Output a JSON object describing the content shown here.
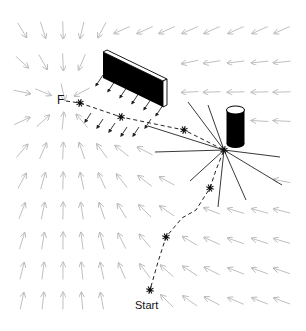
{
  "diagram": {
    "type": "potential-field-navigation",
    "labels": {
      "goal": "F",
      "start": "Start"
    },
    "colors": {
      "field_arrow": "#b8b8b8",
      "obstacle_fill": "#000000",
      "repulsive_line": "#222222",
      "path": "#222222",
      "robot_marker": "#111111"
    },
    "goal_point": [
      65,
      101
    ],
    "goal_label_pos": [
      57,
      93
    ],
    "start_label_pos": [
      135,
      299
    ],
    "robot_positions": [
      [
        80,
        103
      ],
      [
        121,
        117
      ],
      [
        184,
        130
      ],
      [
        224,
        150
      ],
      [
        210,
        188
      ],
      [
        166,
        237
      ],
      [
        150,
        290
      ]
    ],
    "path_points": [
      [
        66,
        101
      ],
      [
        80,
        103
      ],
      [
        121,
        117
      ],
      [
        184,
        130
      ],
      [
        224,
        150
      ],
      [
        216,
        170
      ],
      [
        210,
        188
      ],
      [
        196,
        210
      ],
      [
        182,
        218
      ],
      [
        166,
        237
      ],
      [
        158,
        262
      ],
      [
        150,
        290
      ]
    ],
    "wall": {
      "front": [
        [
          103,
          52
        ],
        [
          163,
          81
        ],
        [
          163,
          107
        ],
        [
          103,
          78
        ]
      ],
      "top": [
        [
          103,
          52
        ],
        [
          107,
          50
        ],
        [
          167,
          79
        ],
        [
          163,
          81
        ]
      ],
      "side": [
        [
          163,
          81
        ],
        [
          167,
          79
        ],
        [
          167,
          105
        ],
        [
          163,
          107
        ]
      ]
    },
    "cylinder": {
      "cx": 235.5,
      "top_y": 110,
      "bottom_y": 144,
      "rx": 9,
      "ry": 4
    },
    "repulsive_center": [
      224,
      150
    ],
    "repulsive_rays": [
      [
        188,
        102
      ],
      [
        208,
        105
      ],
      [
        148,
        126
      ],
      [
        155,
        152
      ],
      [
        280,
        157
      ],
      [
        282,
        185
      ],
      [
        190,
        181
      ],
      [
        218,
        207
      ],
      [
        246,
        200
      ]
    ]
  }
}
